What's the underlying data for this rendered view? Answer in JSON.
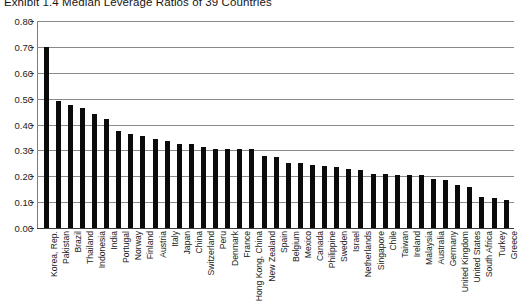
{
  "chart_data": {
    "type": "bar",
    "title": "Exhibit 1.4  Median Leverage Ratios of 39 Countries",
    "xlabel": "",
    "ylabel": "",
    "ylim": [
      0.0,
      0.8
    ],
    "ytick_labels": [
      "0.80",
      "0.70",
      "0.60",
      "0.50",
      "0.40",
      "0.30",
      "0.20",
      "0.10",
      "0.00"
    ],
    "ytick_values": [
      0.8,
      0.7,
      0.6,
      0.5,
      0.4,
      0.3,
      0.2,
      0.1,
      0.0
    ],
    "grid": true,
    "legend": "none",
    "bar_color": "#0b0b0b",
    "categories": [
      "Korea, Rep.",
      "Pakistan",
      "Brazil",
      "Thailand",
      "Indonesia",
      "India",
      "Portugal",
      "Norway",
      "Finland",
      "Austria",
      "Italy",
      "Japan",
      "China",
      "Switzerland",
      "Peru",
      "Denmark",
      "France",
      "Hong Kong, China",
      "New Zealand",
      "Spain",
      "Belgium",
      "Mexico",
      "Canada",
      "Philippine",
      "Sweden",
      "Israel",
      "Netherlands",
      "Singapore",
      "Chile",
      "Taiwan",
      "Ireland",
      "Malaysia",
      "Australia",
      "Germany",
      "United Kingdom",
      "United States",
      "South Africa",
      "Turkey",
      "Greece"
    ],
    "values": [
      0.7,
      0.49,
      0.475,
      0.465,
      0.44,
      0.42,
      0.375,
      0.365,
      0.355,
      0.345,
      0.335,
      0.325,
      0.325,
      0.315,
      0.305,
      0.305,
      0.305,
      0.305,
      0.28,
      0.275,
      0.25,
      0.25,
      0.245,
      0.24,
      0.235,
      0.23,
      0.225,
      0.21,
      0.21,
      0.205,
      0.205,
      0.205,
      0.19,
      0.185,
      0.165,
      0.16,
      0.12,
      0.115,
      0.11
    ]
  }
}
